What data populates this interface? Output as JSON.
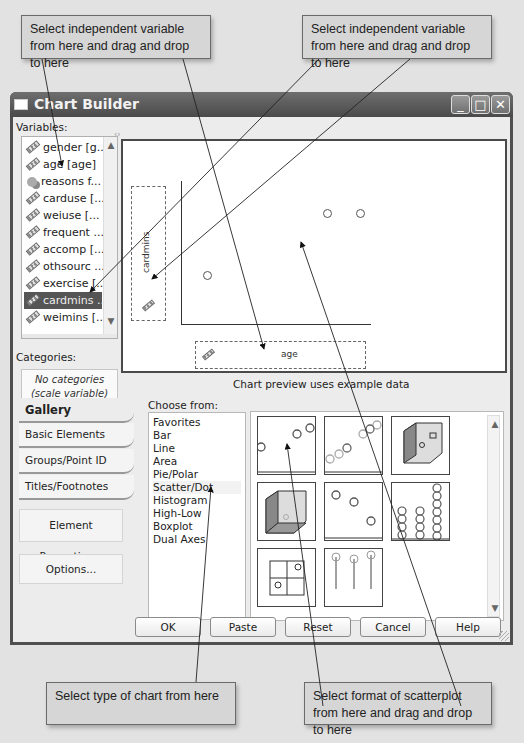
{
  "callouts": {
    "top_left": "Select independent variable from here and drag and drop to here",
    "top_right": "Select independent variable from here and drag and drop to here",
    "bottom_left": "Select type of chart from here",
    "bottom_right": "Select format of scatterplot from here and drag and drop to here"
  },
  "window": {
    "title": "Chart Builder",
    "controls": {
      "minimize": "_",
      "maximize": "□",
      "close": "✕"
    }
  },
  "variables": {
    "label": "Variables:",
    "items": [
      {
        "name": "gender [g...",
        "type": "scale",
        "selected": false
      },
      {
        "name": "age [age]",
        "type": "scale",
        "selected": false
      },
      {
        "name": "reasons f...",
        "type": "nominal",
        "selected": false
      },
      {
        "name": "carduse [...",
        "type": "scale",
        "selected": false
      },
      {
        "name": "weiuse [...",
        "type": "scale",
        "selected": false
      },
      {
        "name": "frequent ...",
        "type": "scale",
        "selected": false
      },
      {
        "name": "accomp [...",
        "type": "scale",
        "selected": false
      },
      {
        "name": "othsourc ...",
        "type": "scale",
        "selected": false
      },
      {
        "name": "exercise [...",
        "type": "scale",
        "selected": false
      },
      {
        "name": "cardmins ...",
        "type": "scale",
        "selected": true
      },
      {
        "name": "weimins [...",
        "type": "scale",
        "selected": false
      }
    ]
  },
  "categories": {
    "label": "Categories:",
    "empty_line1": "No categories",
    "empty_line2": "(scale variable)"
  },
  "preview": {
    "y_axis_label": "cardmins",
    "x_axis_label": "age",
    "caption": "Chart preview uses example data"
  },
  "tabs": [
    {
      "label": "Gallery",
      "active": true
    },
    {
      "label": "Basic Elements",
      "active": false
    },
    {
      "label": "Groups/Point ID",
      "active": false
    },
    {
      "label": "Titles/Footnotes",
      "active": false
    }
  ],
  "side_buttons": {
    "element_properties": "Element Properties...",
    "options": "Options..."
  },
  "choose_from": {
    "label": "Choose from:",
    "items": [
      "Favorites",
      "Bar",
      "Line",
      "Area",
      "Pie/Polar",
      "Scatter/Dot",
      "Histogram",
      "High-Low",
      "Boxplot",
      "Dual Axes"
    ],
    "selected": "Scatter/Dot"
  },
  "gallery_thumbs": [
    "simple-scatter",
    "grouped-scatter",
    "3d-scatter",
    "grouped-3d-scatter",
    "summary-point-plot",
    "simple-dot-plot",
    "scatterplot-matrix",
    "drop-line"
  ],
  "buttons": {
    "ok": "OK",
    "paste": "Paste",
    "reset": "Reset",
    "cancel": "Cancel",
    "help": "Help"
  }
}
